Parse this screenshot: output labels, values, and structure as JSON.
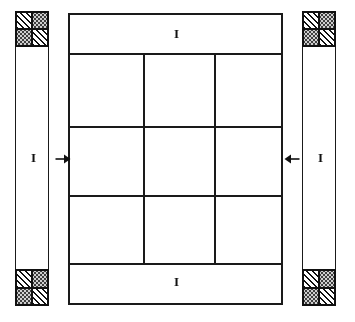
{
  "figure": {
    "type": "engineering-section-diagram",
    "background_color": "#ffffff",
    "line_color": "#1a1a1a"
  },
  "labels": {
    "left_pier": "I",
    "right_pier": "I",
    "top_band": "I",
    "bottom_band": "I"
  },
  "arrows": {
    "left": {
      "name": "load-arrow-left",
      "direction": "right",
      "glyph": "→"
    },
    "right": {
      "name": "load-arrow-right",
      "direction": "left",
      "glyph": "←"
    }
  },
  "hatches": {
    "masonry_symbol": "x",
    "diagonal_fill": "diagonal-hatch",
    "stipple_fill": "dot-stipple"
  },
  "left_pier": {
    "name": "left-pier",
    "top_block": "checker-block",
    "shaft": "masonry-x-fill",
    "bottom_block": "checker-block"
  },
  "right_pier": {
    "name": "right-pier",
    "top_block": "checker-block",
    "shaft": "masonry-x-fill",
    "bottom_block": "checker-block"
  },
  "center_panel": {
    "name": "center-panel",
    "top_band": "masonry-x-band",
    "bottom_band": "masonry-x-band",
    "grid_rows": 3,
    "grid_cols": 3,
    "cells": [
      [
        "",
        "",
        ""
      ],
      [
        "",
        "",
        ""
      ],
      [
        "",
        "",
        ""
      ]
    ]
  },
  "checker_cells": {
    "top_left": "diagonal-hatch",
    "top_right": "dot-stipple",
    "bottom_left": "dot-stipple",
    "bottom_right": "diagonal-hatch"
  }
}
